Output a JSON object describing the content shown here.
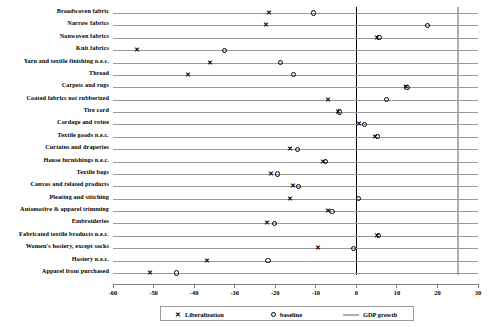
{
  "chart_data": {
    "type": "scatter",
    "title": "",
    "xlabel": "",
    "ylabel": "",
    "orientation": "horizontal",
    "xlim": [
      -60,
      30
    ],
    "xticks": [
      -60,
      -50,
      -40,
      -30,
      -20,
      -10,
      0,
      10,
      20,
      30
    ],
    "xticklabels": [
      "-60",
      "-50",
      "-40",
      "-30",
      "-20",
      "-10",
      "0",
      "10",
      "20",
      "30"
    ],
    "grid": true,
    "legend_position": "bottom",
    "categories": [
      "Broadwoven fabric",
      "Narrow fabrics",
      "Nonwoven fabrics",
      "Knit fabrics",
      "Yarn and textile finishing n.e.c.",
      "Thread",
      "Carpets and rugs",
      "Coated fabrics not rubberized",
      "Tire cord",
      "Cordage and twine",
      "Textile goods n.e.c.",
      "Curtains and draperies",
      "House furnishings n.e.c.",
      "Textile bags",
      "Canvas and related products",
      "Pleating and stitching",
      "Automotive & apparel trimming",
      "Embroideries",
      "Fabricated textile broducts n.e.c.",
      "Women's hosiery, except socks",
      "Hosiery n.e.c.",
      "Apparel from purchased"
    ],
    "series": [
      {
        "name": "Liberalization",
        "marker": "x",
        "color": "#000000",
        "values": [
          -21.6,
          -22.3,
          5.0,
          -54.1,
          -36.1,
          -41.6,
          12.2,
          -7.0,
          -4.6,
          0.7,
          4.7,
          -16.3,
          -8.3,
          -21.0,
          -15.7,
          -16.3,
          -7.0,
          -22.1,
          5.0,
          -9.4,
          -36.8,
          -50.9
        ]
      },
      {
        "name": "baseline",
        "marker": "o",
        "color": "#000000",
        "values": [
          -10.5,
          17.6,
          5.6,
          -32.6,
          -18.6,
          -15.4,
          12.5,
          7.5,
          -4.2,
          2.0,
          5.2,
          -14.5,
          -7.6,
          -19.4,
          -14.2,
          0.6,
          -6.0,
          -20.1,
          5.4,
          -0.7,
          -21.8,
          -44.4
        ]
      }
    ],
    "reference_lines": [
      {
        "name": "zero",
        "value": 0,
        "color": "#000000",
        "width": 1.6
      },
      {
        "name": "GDP growth",
        "value": 25.0,
        "color": "#b0b0b0",
        "width": 1.6
      }
    ]
  },
  "legend": {
    "entries": [
      {
        "label": "Liberalization",
        "marker": "x"
      },
      {
        "label": "baseline",
        "marker": "o"
      },
      {
        "label": "GDP  growth",
        "marker": "line"
      }
    ]
  }
}
